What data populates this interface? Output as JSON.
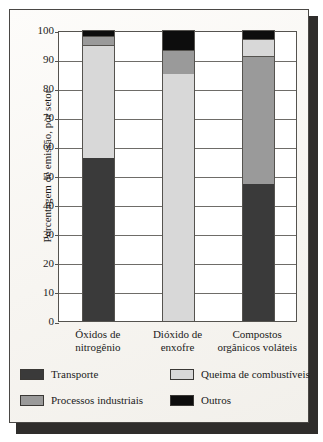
{
  "figure": {
    "background_color": "#fbfaf7",
    "frame_color": "#4a4845",
    "shadow_color": "#2f2d2b"
  },
  "chart_data": {
    "type": "bar",
    "subtype": "stacked-bar",
    "title": "",
    "xlabel": "",
    "ylabel": "Porcentagem de emissão, por setor",
    "ylim": [
      0,
      100
    ],
    "yticks": [
      0,
      10,
      20,
      30,
      40,
      50,
      60,
      70,
      80,
      90,
      100
    ],
    "ytick_labels": [
      "0",
      "10",
      "20",
      "30",
      "40",
      "50",
      "60",
      "70",
      "80",
      "90",
      "100"
    ],
    "grid": true,
    "legend_position": "bottom",
    "categories": [
      "Óxidos de nitrogênio",
      "Dióxido de enxofre",
      "Compostos orgânicos voláteis"
    ],
    "category_lines": [
      [
        "Óxidos de",
        "nitrogênio"
      ],
      [
        "Dióxido de",
        "enxofre"
      ],
      [
        "Compostos",
        "orgânicos voláteis"
      ]
    ],
    "series": [
      {
        "name": "Transporte",
        "color": "#3a3a3a",
        "values": [
          56,
          0,
          47
        ]
      },
      {
        "name": "Queima de combustíveis",
        "color": "#d8d8d8",
        "values": [
          39,
          85,
          6
        ]
      },
      {
        "name": "Processos industriais",
        "color": "#9a9a9a",
        "values": [
          3,
          8,
          44
        ]
      },
      {
        "name": "Outros",
        "color": "#0d0d0d",
        "values": [
          2,
          7,
          3
        ]
      }
    ],
    "stack_order_per_category": [
      [
        "Transporte",
        "Queima de combustíveis",
        "Processos industriais",
        "Outros"
      ],
      [
        "Queima de combustíveis",
        "Processos industriais",
        "Outros"
      ],
      [
        "Transporte",
        "Processos industriais",
        "Queima de combustíveis",
        "Outros"
      ]
    ],
    "segments": [
      {
        "category": "Óxidos de nitrogênio",
        "parts": [
          {
            "series": "Transporte",
            "from": 0,
            "to": 56,
            "value": 56,
            "color": "#3a3a3a"
          },
          {
            "series": "Queima de combustíveis",
            "from": 56,
            "to": 95,
            "value": 39,
            "color": "#d8d8d8"
          },
          {
            "series": "Processos industriais",
            "from": 95,
            "to": 98,
            "value": 3,
            "color": "#9a9a9a"
          },
          {
            "series": "Outros",
            "from": 98,
            "to": 100,
            "value": 2,
            "color": "#0d0d0d"
          }
        ]
      },
      {
        "category": "Dióxido de enxofre",
        "parts": [
          {
            "series": "Queima de combustíveis",
            "from": 0,
            "to": 85,
            "value": 85,
            "color": "#d8d8d8"
          },
          {
            "series": "Processos industriais",
            "from": 85,
            "to": 93,
            "value": 8,
            "color": "#9a9a9a"
          },
          {
            "series": "Outros",
            "from": 93,
            "to": 100,
            "value": 7,
            "color": "#0d0d0d"
          }
        ]
      },
      {
        "category": "Compostos orgânicos voláteis",
        "parts": [
          {
            "series": "Transporte",
            "from": 0,
            "to": 47,
            "value": 47,
            "color": "#3a3a3a"
          },
          {
            "series": "Processos industriais",
            "from": 47,
            "to": 91,
            "value": 44,
            "color": "#9a9a9a"
          },
          {
            "series": "Queima de combustíveis",
            "from": 91,
            "to": 97,
            "value": 6,
            "color": "#d8d8d8"
          },
          {
            "series": "Outros",
            "from": 97,
            "to": 100,
            "value": 3,
            "color": "#0d0d0d"
          }
        ]
      }
    ],
    "legend": [
      {
        "label": "Transporte",
        "color": "#3a3a3a"
      },
      {
        "label": "Queima de combustíveis",
        "color": "#d8d8d8"
      },
      {
        "label": "Processos industriais",
        "color": "#9a9a9a"
      },
      {
        "label": "Outros",
        "color": "#0d0d0d"
      }
    ]
  }
}
